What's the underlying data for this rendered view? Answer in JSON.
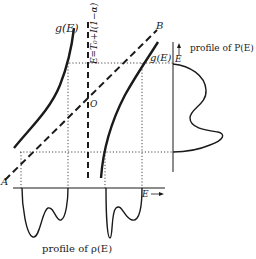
{
  "diagram": {
    "type": "energy-distribution schematic",
    "labels": {
      "g_left": "g(E)",
      "g_right": "g(E)",
      "point_A": "A",
      "point_B": "B",
      "origin": "O",
      "vertical_line": "E=T₀+I(1−α)",
      "E_vertical_axis": "E",
      "E_horizontal_axis": "E",
      "profile_P": "profile of P(E)",
      "profile_rho": "profile of ρ(E)"
    },
    "colors": {
      "ink": "#1a1a1a",
      "background": "#ffffff"
    },
    "elements": [
      "left g(E) curve (solid)",
      "right g(E) curve (solid)",
      "dashed line A to B",
      "vertical dashed line E=T0+I(1-alpha) through O",
      "horizontal dotted guide lines",
      "vertical dotted guide lines",
      "P(E) profile on vertical E axis",
      "rho(E) profile below horizontal E axis"
    ]
  }
}
